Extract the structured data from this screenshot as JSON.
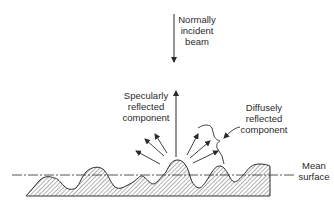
{
  "figure": {
    "labels": {
      "incident": [
        "Normally",
        "incident",
        "beam"
      ],
      "specular": [
        "Specularly",
        "reflected",
        "component"
      ],
      "diffuse": [
        "Diffusely",
        "reflected",
        "component"
      ],
      "mean_surface": [
        "Mean",
        "surface"
      ]
    },
    "colors": {
      "ink": "#2a2a2a",
      "hatch": "#555555",
      "background": "#ffffff"
    }
  }
}
